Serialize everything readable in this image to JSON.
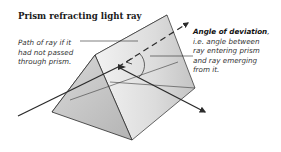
{
  "title": "Prism refracting light ray",
  "labels": {
    "undeviated_path": {
      "lines": [
        "Path of ray if it",
        "had not passed",
        "through prism."
      ]
    },
    "angle_of_deviation": {
      "heading": "Angle of deviation",
      "heading_suffix": ",",
      "lines": [
        "i.e. angle between",
        "ray entering prism",
        "and ray emerging",
        "from it."
      ]
    }
  },
  "colors": {
    "outline": "#2a2a2a",
    "face_light": "#e6e6e6",
    "face_mid": "#cfcfcf",
    "face_dark": "#b9b9b9",
    "ray": "#2b2b2b"
  }
}
